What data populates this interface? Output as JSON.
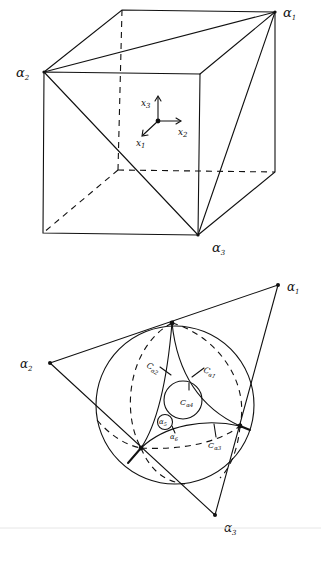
{
  "figure_top": {
    "title": "Cube with vertices alpha1, alpha2, alpha3",
    "labels": {
      "alpha1": {
        "base": "α",
        "sub": "1"
      },
      "alpha2": {
        "base": "α",
        "sub": "2"
      },
      "alpha3": {
        "base": "α",
        "sub": "3"
      },
      "x1": {
        "base": "x",
        "sub": "1"
      },
      "x2": {
        "base": "x",
        "sub": "2"
      },
      "x3": {
        "base": "x",
        "sub": "3"
      }
    }
  },
  "figure_bottom": {
    "title": "Sphere with circles C_alpha",
    "labels": {
      "alpha1": {
        "base": "α",
        "sub": "1"
      },
      "alpha2": {
        "base": "α",
        "sub": "2"
      },
      "alpha3": {
        "base": "α",
        "sub": "3"
      },
      "c_alpha1": {
        "base": "C",
        "sub": "α1"
      },
      "c_alpha2": {
        "base": "C",
        "sub": "α2"
      },
      "c_alpha3": {
        "base": "C",
        "sub": "α3"
      },
      "c_alpha4": {
        "base": "C",
        "sub": "α4"
      },
      "alpha5": {
        "base": "α",
        "sub": "5"
      },
      "alpha6": {
        "base": "α",
        "sub": "6"
      }
    }
  }
}
